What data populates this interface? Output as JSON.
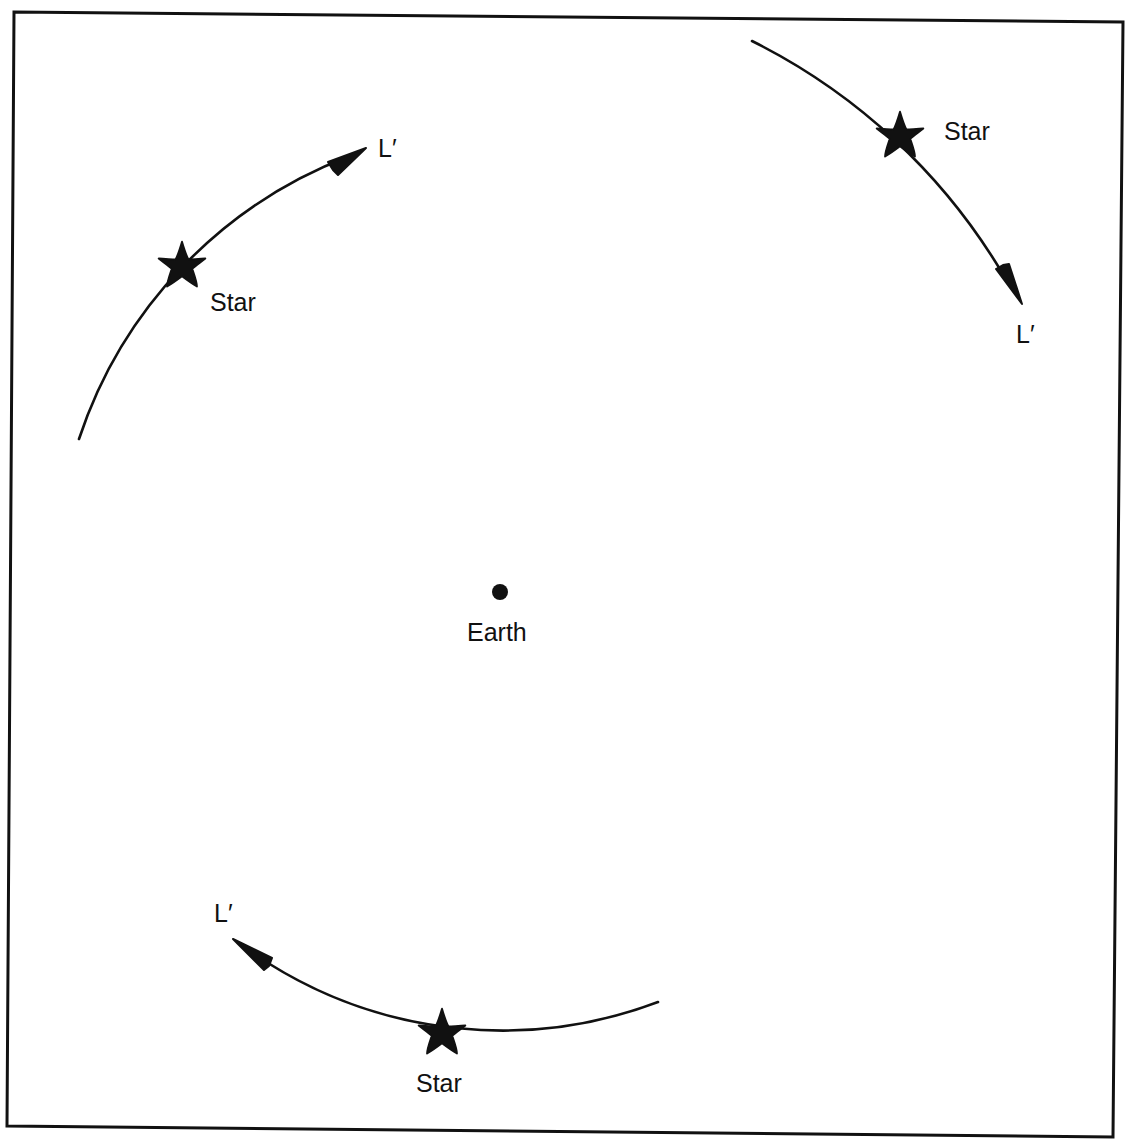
{
  "diagram": {
    "type": "celestial-motion-diagram",
    "colors": {
      "background": "#ffffff",
      "ink": "#111111"
    },
    "center": {
      "label": "Earth",
      "x": 500,
      "y": 592
    },
    "arcs": [
      {
        "id": "top-left",
        "star_label": "Star",
        "arrow_label": "L′",
        "radius": 455,
        "start": [
          79,
          439
        ],
        "star": [
          182,
          266
        ],
        "arrow_tip": [
          365,
          149
        ],
        "direction": "clockwise"
      },
      {
        "id": "top-right",
        "star_label": "Star",
        "arrow_label": "L′",
        "radius": 605,
        "start": [
          752,
          41
        ],
        "star": [
          900,
          136
        ],
        "arrow_tip": [
          1022,
          303
        ],
        "direction": "clockwise"
      },
      {
        "id": "bottom",
        "star_label": "Star",
        "arrow_label": "L′",
        "radius": 440,
        "start": [
          658,
          1002
        ],
        "star": [
          442,
          1033
        ],
        "arrow_tip": [
          234,
          940
        ],
        "direction": "clockwise"
      }
    ]
  },
  "labels": {
    "earth": "Earth",
    "star_top_left": "Star",
    "star_top_right": "Star",
    "star_bottom": "Star",
    "lprime_top_left": "L′",
    "lprime_top_right": "L′",
    "lprime_bottom": "L′"
  }
}
